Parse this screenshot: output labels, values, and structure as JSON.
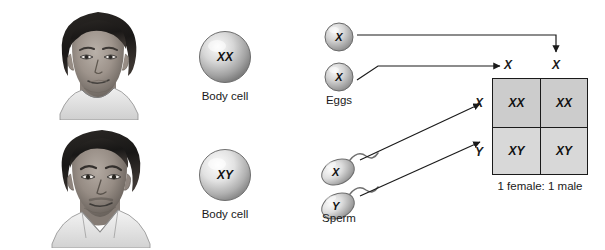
{
  "diagram": {
    "parents": [
      {
        "portrait": "female-portrait",
        "genotype": "XX",
        "cell_label": "Body cell"
      },
      {
        "portrait": "male-portrait",
        "genotype": "XY",
        "cell_label": "Body cell"
      }
    ],
    "gametes": {
      "eggs": {
        "label": "Eggs",
        "alleles": [
          "X",
          "X"
        ]
      },
      "sperm": {
        "label": "Sperm",
        "alleles": [
          "X",
          "Y"
        ]
      }
    },
    "punnett": {
      "column_headers": [
        "X",
        "X"
      ],
      "row_headers": [
        "X",
        "Y"
      ],
      "cells": [
        [
          "XX",
          "XX"
        ],
        [
          "XY",
          "XY"
        ]
      ],
      "ratio_caption": "1 female: 1 male"
    },
    "colors": {
      "cell_fill": "#d2d2d2",
      "grid_line": "#1a1a1a",
      "text": "#1a1a1a",
      "sphere_light": "#f2f2f2",
      "sphere_dark": "#8d8d8d"
    }
  }
}
